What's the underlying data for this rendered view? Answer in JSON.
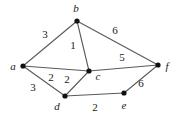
{
  "figure": {
    "name": "weighted-undirected-graph",
    "background_color": "#ffffff",
    "edge_color": "#5a5a5a",
    "vertex_color": "#111111",
    "label_color": "#1a1a1a"
  },
  "chart_data": {
    "type": "diagram",
    "title": "",
    "graph_kind": "weighted undirected graph",
    "nodes": [
      {
        "id": "a",
        "label": "a",
        "x": 23,
        "y": 66,
        "label_x": 13,
        "label_y": 66
      },
      {
        "id": "b",
        "label": "b",
        "x": 77,
        "y": 21,
        "label_x": 76,
        "label_y": 8
      },
      {
        "id": "c",
        "label": "c",
        "x": 89,
        "y": 71,
        "label_x": 98,
        "label_y": 76
      },
      {
        "id": "d",
        "label": "d",
        "x": 65,
        "y": 96,
        "label_x": 57,
        "label_y": 106
      },
      {
        "id": "e",
        "label": "e",
        "x": 124,
        "y": 93,
        "label_x": 124,
        "label_y": 105
      },
      {
        "id": "f",
        "label": "f",
        "x": 158,
        "y": 65,
        "label_x": 167,
        "label_y": 66
      }
    ],
    "edges": [
      {
        "source": "a",
        "target": "b",
        "weight": 3,
        "label": "3",
        "label_x": 45,
        "label_y": 34
      },
      {
        "source": "b",
        "target": "c",
        "weight": 1,
        "label": "1",
        "label_x": 73,
        "label_y": 45
      },
      {
        "source": "b",
        "target": "f",
        "weight": 6,
        "label": "6",
        "label_x": 115,
        "label_y": 30
      },
      {
        "source": "a",
        "target": "c",
        "weight": 2,
        "label": "2",
        "label_x": 51,
        "label_y": 77
      },
      {
        "source": "c",
        "target": "d",
        "weight": 2,
        "label": "2",
        "label_x": 67,
        "label_y": 79
      },
      {
        "source": "a",
        "target": "d",
        "weight": 3,
        "label": "3",
        "label_x": 33,
        "label_y": 87
      },
      {
        "source": "c",
        "target": "f",
        "weight": 5,
        "label": "5",
        "label_x": 122,
        "label_y": 57
      },
      {
        "source": "d",
        "target": "e",
        "weight": 2,
        "label": "2",
        "label_x": 95,
        "label_y": 107
      },
      {
        "source": "e",
        "target": "f",
        "weight": 6,
        "label": "6",
        "label_x": 141,
        "label_y": 83
      }
    ],
    "vertex_labels": [
      "a",
      "b",
      "c",
      "d",
      "e",
      "f"
    ],
    "edge_weights": [
      3,
      1,
      6,
      2,
      2,
      3,
      5,
      2,
      6
    ]
  }
}
